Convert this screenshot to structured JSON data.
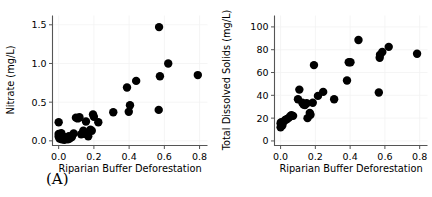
{
  "figure": {
    "panel_count": 2,
    "background_color": "#ffffff",
    "marker_color": "#000000",
    "axis_color": "#555555",
    "grid_color": "#f2f2f2"
  },
  "panels": [
    {
      "tag": "(A)",
      "tag_name": "panel-a-tag"
    },
    {
      "tag": "(B)",
      "tag_name": "panel-b-tag"
    }
  ],
  "chart_data": [
    {
      "type": "scatter",
      "title": "",
      "panel_label": "(A)",
      "xlabel": "Riparian Buffer Deforestation",
      "ylabel": "Nitrate (mg/L)",
      "xlim": [
        -0.035,
        0.845
      ],
      "ylim": [
        -0.06,
        1.62
      ],
      "xticks": [
        0.0,
        0.2,
        0.4,
        0.6,
        0.8
      ],
      "xticklabels": [
        "0.0",
        "0.2",
        "0.4",
        "0.6",
        "0.8"
      ],
      "yticks": [
        0.0,
        0.5,
        1.0,
        1.5
      ],
      "yticklabels": [
        "0.0",
        "0.5",
        "1.0",
        "1.5"
      ],
      "grid": true,
      "legend": "none",
      "marker": "circle",
      "marker_size": 4.2,
      "points": [
        {
          "x": 0.0,
          "y": 0.24
        },
        {
          "x": 0.0,
          "y": 0.09
        },
        {
          "x": 0.0,
          "y": 0.055
        },
        {
          "x": 0.005,
          "y": 0.03
        },
        {
          "x": 0.008,
          "y": 0.075
        },
        {
          "x": 0.012,
          "y": 0.035
        },
        {
          "x": 0.015,
          "y": 0.1
        },
        {
          "x": 0.018,
          "y": 0.02
        },
        {
          "x": 0.022,
          "y": 0.06
        },
        {
          "x": 0.028,
          "y": 0.03
        },
        {
          "x": 0.032,
          "y": 0.015
        },
        {
          "x": 0.038,
          "y": 0.045
        },
        {
          "x": 0.045,
          "y": 0.025
        },
        {
          "x": 0.052,
          "y": 0.02
        },
        {
          "x": 0.058,
          "y": 0.06
        },
        {
          "x": 0.062,
          "y": 0.03
        },
        {
          "x": 0.075,
          "y": 0.05
        },
        {
          "x": 0.085,
          "y": 0.095
        },
        {
          "x": 0.098,
          "y": 0.3
        },
        {
          "x": 0.108,
          "y": 0.29
        },
        {
          "x": 0.118,
          "y": 0.305
        },
        {
          "x": 0.128,
          "y": 0.085
        },
        {
          "x": 0.14,
          "y": 0.13
        },
        {
          "x": 0.148,
          "y": 0.09
        },
        {
          "x": 0.155,
          "y": 0.25
        },
        {
          "x": 0.168,
          "y": 0.06
        },
        {
          "x": 0.18,
          "y": 0.145
        },
        {
          "x": 0.188,
          "y": 0.13
        },
        {
          "x": 0.195,
          "y": 0.34
        },
        {
          "x": 0.2,
          "y": 0.31
        },
        {
          "x": 0.225,
          "y": 0.24
        },
        {
          "x": 0.31,
          "y": 0.37
        },
        {
          "x": 0.388,
          "y": 0.69
        },
        {
          "x": 0.398,
          "y": 0.375
        },
        {
          "x": 0.405,
          "y": 0.46
        },
        {
          "x": 0.44,
          "y": 0.775
        },
        {
          "x": 0.57,
          "y": 1.47
        },
        {
          "x": 0.568,
          "y": 0.4
        },
        {
          "x": 0.575,
          "y": 0.835
        },
        {
          "x": 0.622,
          "y": 1.0
        },
        {
          "x": 0.79,
          "y": 0.85
        }
      ]
    },
    {
      "type": "scatter",
      "title": "",
      "panel_label": "(B)",
      "xlabel": "Riparian Buffer Deforestation",
      "ylabel": "Total Dissolved Solids (mg/L)",
      "xlim": [
        -0.035,
        0.845
      ],
      "ylim": [
        -4,
        110
      ],
      "xticks": [
        0.0,
        0.2,
        0.4,
        0.6,
        0.8
      ],
      "xticklabels": [
        "0.0",
        "0.2",
        "0.4",
        "0.6",
        "0.8"
      ],
      "yticks": [
        0,
        20,
        40,
        60,
        80,
        100
      ],
      "yticklabels": [
        "0",
        "20",
        "40",
        "60",
        "80",
        "100"
      ],
      "grid": true,
      "legend": "none",
      "marker": "circle",
      "marker_size": 4.2,
      "points": [
        {
          "x": 0.0,
          "y": 12.0
        },
        {
          "x": 0.0,
          "y": 15.5
        },
        {
          "x": 0.004,
          "y": 16.5
        },
        {
          "x": 0.01,
          "y": 13.5
        },
        {
          "x": 0.018,
          "y": 17.0
        },
        {
          "x": 0.028,
          "y": 18.5
        },
        {
          "x": 0.035,
          "y": 19.0
        },
        {
          "x": 0.045,
          "y": 20.0
        },
        {
          "x": 0.055,
          "y": 21.5
        },
        {
          "x": 0.062,
          "y": 22.5
        },
        {
          "x": 0.072,
          "y": 22.0
        },
        {
          "x": 0.1,
          "y": 36.5
        },
        {
          "x": 0.108,
          "y": 45.0
        },
        {
          "x": 0.125,
          "y": 33.5
        },
        {
          "x": 0.132,
          "y": 32.0
        },
        {
          "x": 0.14,
          "y": 31.5
        },
        {
          "x": 0.15,
          "y": 33.0
        },
        {
          "x": 0.155,
          "y": 20.0
        },
        {
          "x": 0.168,
          "y": 24.5
        },
        {
          "x": 0.172,
          "y": 23.0
        },
        {
          "x": 0.185,
          "y": 33.5
        },
        {
          "x": 0.192,
          "y": 66.5
        },
        {
          "x": 0.215,
          "y": 39.5
        },
        {
          "x": 0.245,
          "y": 43.0
        },
        {
          "x": 0.308,
          "y": 36.5
        },
        {
          "x": 0.382,
          "y": 53.0
        },
        {
          "x": 0.392,
          "y": 69.0
        },
        {
          "x": 0.402,
          "y": 69.0
        },
        {
          "x": 0.448,
          "y": 88.5
        },
        {
          "x": 0.565,
          "y": 42.5
        },
        {
          "x": 0.57,
          "y": 73.0
        },
        {
          "x": 0.572,
          "y": 75.5
        },
        {
          "x": 0.585,
          "y": 78.0
        },
        {
          "x": 0.622,
          "y": 82.5
        },
        {
          "x": 0.785,
          "y": 76.5
        }
      ]
    }
  ]
}
